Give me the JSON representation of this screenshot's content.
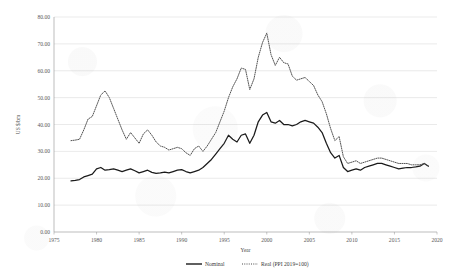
{
  "chart_data": {
    "type": "line",
    "title": "",
    "xlabel": "Year",
    "ylabel": "US $/bm",
    "xlim": [
      1975,
      2020
    ],
    "ylim": [
      0,
      80
    ],
    "xticks": [
      "1975",
      "1980",
      "1985",
      "1990",
      "1995",
      "2000",
      "2005",
      "2010",
      "2015",
      "2020"
    ],
    "yticks": [
      "0.00",
      "10.00",
      "20.00",
      "30.00",
      "40.00",
      "50.00",
      "60.00",
      "70.00",
      "80.00"
    ],
    "grid": "horizontal",
    "legend_position": "bottom-center",
    "legend": [
      "Nominal",
      "Real (PPI 2019=100)"
    ],
    "x": [
      1977.0,
      1977.5,
      1978.0,
      1978.5,
      1979.0,
      1979.5,
      1980.0,
      1980.5,
      1981.0,
      1981.5,
      1982.0,
      1982.5,
      1983.0,
      1983.5,
      1984.0,
      1984.5,
      1985.0,
      1985.5,
      1986.0,
      1986.5,
      1987.0,
      1987.5,
      1988.0,
      1988.5,
      1989.0,
      1989.5,
      1990.0,
      1990.5,
      1991.0,
      1991.5,
      1992.0,
      1992.5,
      1993.0,
      1993.5,
      1994.0,
      1994.5,
      1995.0,
      1995.5,
      1996.0,
      1996.5,
      1997.0,
      1997.5,
      1998.0,
      1998.5,
      1999.0,
      1999.5,
      2000.0,
      2000.5,
      2001.0,
      2001.5,
      2002.0,
      2002.5,
      2003.0,
      2003.5,
      2004.0,
      2004.5,
      2005.0,
      2005.5,
      2006.0,
      2006.5,
      2007.0,
      2007.5,
      2008.0,
      2008.5,
      2009.0,
      2009.5,
      2010.0,
      2010.5,
      2011.0,
      2011.5,
      2012.0,
      2012.5,
      2013.0,
      2013.5,
      2014.0,
      2014.5,
      2015.0,
      2015.5,
      2016.0,
      2016.5,
      2017.0,
      2017.5,
      2018.0,
      2018.5,
      2019.0
    ],
    "series": [
      {
        "name": "Nominal",
        "style": "solid",
        "color": "#1a1a1a",
        "values": [
          19.0,
          19.2,
          19.5,
          20.5,
          21.0,
          21.5,
          23.5,
          24.0,
          23.0,
          23.2,
          23.5,
          23.0,
          22.5,
          23.0,
          23.5,
          22.8,
          22.0,
          22.5,
          23.0,
          22.2,
          21.8,
          22.0,
          22.3,
          22.0,
          22.5,
          23.0,
          23.2,
          22.5,
          22.0,
          22.5,
          23.0,
          24.0,
          25.5,
          27.0,
          29.0,
          31.0,
          33.0,
          36.0,
          34.5,
          33.5,
          36.0,
          36.5,
          33.0,
          36.0,
          41.0,
          43.5,
          44.5,
          41.0,
          40.5,
          41.5,
          40.0,
          40.0,
          39.5,
          40.0,
          41.0,
          41.5,
          41.0,
          40.5,
          39.0,
          37.0,
          33.0,
          29.5,
          27.5,
          28.5,
          24.0,
          22.5,
          23.0,
          23.5,
          23.0,
          24.0,
          24.5,
          25.0,
          25.5,
          25.5,
          25.0,
          24.5,
          24.0,
          23.5,
          23.8,
          24.0,
          24.0,
          24.2,
          24.5,
          25.5,
          24.5
        ]
      },
      {
        "name": "Real (PPI 2019=100)",
        "style": "dotted",
        "color": "#4a4a4a",
        "values": [
          34.0,
          34.2,
          34.5,
          38.0,
          42.0,
          43.0,
          47.0,
          51.0,
          52.5,
          50.0,
          46.0,
          42.0,
          38.0,
          34.5,
          37.0,
          35.0,
          33.0,
          36.5,
          38.0,
          36.0,
          33.5,
          32.0,
          31.5,
          30.5,
          31.0,
          31.5,
          31.0,
          29.5,
          28.5,
          31.0,
          32.0,
          30.0,
          32.0,
          34.5,
          37.0,
          41.0,
          45.0,
          50.0,
          54.0,
          57.0,
          61.0,
          60.5,
          53.0,
          57.0,
          65.0,
          70.5,
          74.0,
          66.0,
          62.0,
          65.0,
          63.0,
          62.5,
          58.0,
          56.5,
          57.0,
          57.5,
          56.0,
          54.5,
          51.0,
          48.5,
          44.0,
          38.5,
          34.0,
          35.5,
          28.0,
          25.5,
          26.0,
          26.5,
          25.5,
          26.0,
          26.5,
          27.0,
          27.5,
          27.5,
          27.0,
          26.5,
          26.0,
          25.5,
          25.5,
          25.5,
          25.0,
          25.0,
          25.0,
          25.5,
          24.5
        ]
      }
    ]
  }
}
